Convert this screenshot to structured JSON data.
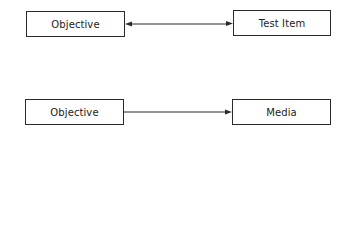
{
  "diagram": {
    "rows": [
      {
        "left": {
          "label": "Objective"
        },
        "right": {
          "label": "Test Item"
        },
        "connector": {
          "type": "bidirectional-arrow"
        }
      },
      {
        "left": {
          "label": "Objective"
        },
        "right": {
          "label": "Media"
        },
        "connector": {
          "type": "unidirectional-arrow",
          "direction": "left-to-right"
        }
      }
    ],
    "colors": {
      "line": "#2a2a2a",
      "background": "#ffffff"
    }
  }
}
